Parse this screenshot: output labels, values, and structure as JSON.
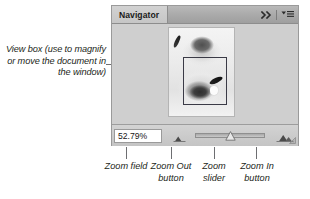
{
  "panel": {
    "tab_label": "Navigator",
    "collapse_icon": "double-chevron-right-icon",
    "menu_icon": "panel-menu-icon",
    "thumbnail_alt": "document-thumbnail",
    "view_box_name": "view-box-overlay"
  },
  "bottom_bar": {
    "zoom_value": "52.79%",
    "zoom_out_icon": "small-mountain-icon",
    "zoom_in_icon": "large-mountain-icon",
    "slider_name": "zoom-slider",
    "resize_grip": "resize-grip-icon"
  },
  "annotations": {
    "view_box": "View box (use to magnify or move the document in the window)",
    "zoom_field": "Zoom field",
    "zoom_out_button": "Zoom Out button",
    "zoom_slider": "Zoom slider",
    "zoom_in_button": "Zoom In button"
  },
  "colors": {
    "panel_bg": "#cfcfcf",
    "titlebar_bg": "#a9a9a9",
    "tab_bg": "#cccccc",
    "field_bg": "#ffffff",
    "view_box_stroke": "#3a3a46",
    "leader_line": "#6d6e71",
    "text": "#231f20"
  }
}
